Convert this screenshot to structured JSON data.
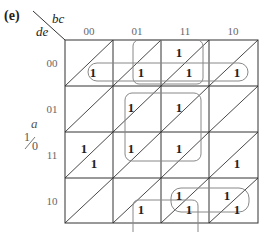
{
  "figure_label": "(e)",
  "corner": {
    "col_var": "bc",
    "row_var": "de"
  },
  "col_headers": [
    "00",
    "01",
    "11",
    "10"
  ],
  "row_headers": [
    "00",
    "01",
    "11",
    "10"
  ],
  "side_var": {
    "name": "a",
    "upper": "1",
    "lower": "0"
  },
  "cell_entries": [
    {
      "row": 0,
      "col": 0,
      "half": "lower",
      "value": "1"
    },
    {
      "row": 0,
      "col": 1,
      "half": "lower",
      "value": "1"
    },
    {
      "row": 0,
      "col": 2,
      "half": "upper",
      "value": "1"
    },
    {
      "row": 0,
      "col": 2,
      "half": "lower",
      "value": "1"
    },
    {
      "row": 0,
      "col": 3,
      "half": "lower",
      "value": "1"
    },
    {
      "row": 1,
      "col": 1,
      "half": "upper",
      "value": "1"
    },
    {
      "row": 1,
      "col": 2,
      "half": "upper",
      "value": "1"
    },
    {
      "row": 2,
      "col": 0,
      "half": "upper",
      "value": "1"
    },
    {
      "row": 2,
      "col": 0,
      "half": "lower",
      "value": "1"
    },
    {
      "row": 2,
      "col": 1,
      "half": "upper",
      "value": "1"
    },
    {
      "row": 2,
      "col": 2,
      "half": "upper",
      "value": "1"
    },
    {
      "row": 2,
      "col": 3,
      "half": "lower",
      "value": "1"
    },
    {
      "row": 3,
      "col": 1,
      "half": "lower",
      "value": "1"
    },
    {
      "row": 3,
      "col": 2,
      "half": "upper",
      "value": "1"
    },
    {
      "row": 3,
      "col": 2,
      "half": "lower",
      "value": "1"
    },
    {
      "row": 3,
      "col": 3,
      "half": "upper",
      "value": "1"
    },
    {
      "row": 3,
      "col": 3,
      "half": "lower",
      "value": "1"
    }
  ],
  "colors": {
    "grid": "#333333",
    "loop": "#888888",
    "text": "#222222"
  }
}
